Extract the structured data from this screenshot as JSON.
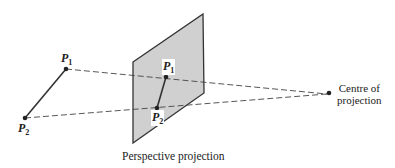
{
  "diagram": {
    "caption": "Perspective projection",
    "centre_label_line1": "Centre of",
    "centre_label_line2": "projection",
    "points": {
      "p1": {
        "base": "P",
        "sub": "1",
        "prime": ""
      },
      "p2": {
        "base": "P",
        "sub": "2",
        "prime": ""
      },
      "p1_proj": {
        "base": "P",
        "sub": "1",
        "prime": "′"
      },
      "p2_proj": {
        "base": "P",
        "sub": "2",
        "prime": "′"
      }
    },
    "colors": {
      "plane_fill": "#d0d0d0",
      "stroke": "#333333"
    }
  }
}
